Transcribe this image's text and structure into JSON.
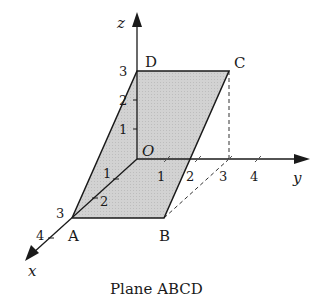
{
  "figure": {
    "caption": "Plane ABCD",
    "colors": {
      "plane_fill": "#cfcfcf",
      "stroke": "#1a1a1a",
      "background": "#ffffff"
    }
  },
  "axes": {
    "x_label": "x",
    "y_label": "y",
    "z_label": "z",
    "origin_label": "O",
    "x_ticks": [
      "1",
      "2",
      "3",
      "4"
    ],
    "y_ticks": [
      "1",
      "2",
      "3",
      "4"
    ],
    "z_ticks": [
      "1",
      "2",
      "3"
    ]
  },
  "points": {
    "A": "A",
    "B": "B",
    "C": "C",
    "D": "D"
  }
}
